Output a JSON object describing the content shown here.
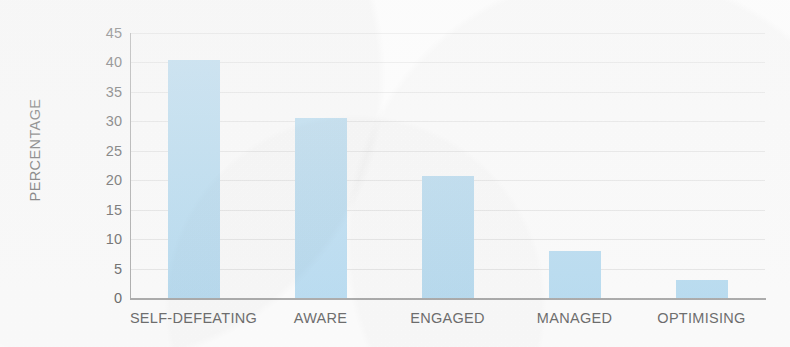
{
  "chart_data": {
    "type": "bar",
    "title": "",
    "subtitle": "",
    "xlabel": "",
    "ylabel": "PERCENTAGE",
    "categories": [
      "SELF-DEFEATING",
      "AWARE",
      "ENGAGED",
      "MANAGED",
      "OPTIMISING"
    ],
    "values": [
      40.5,
      30.5,
      20.7,
      8.0,
      3.0
    ],
    "ylim": [
      0,
      45
    ],
    "ytick_step": 5,
    "yticks": [
      45,
      40,
      35,
      30,
      25,
      20,
      15,
      10,
      5,
      0
    ],
    "ytick_labels": [
      "45",
      "40",
      "35",
      "30",
      "25",
      "20",
      "15",
      "10",
      "5",
      "0"
    ],
    "grid": true,
    "grid_axis": "y",
    "legend": false,
    "legend_position": "none",
    "bar_color": "#abd6f0",
    "grid_color": "#e3e3e3",
    "axis_color": "#9a9a9a",
    "text_color": "#4a4a4a",
    "background_color": "#fdfdfd"
  }
}
